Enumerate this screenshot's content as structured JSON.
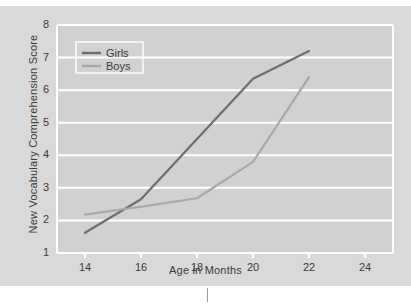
{
  "chart_data": {
    "type": "line",
    "title": "",
    "xlabel": "Age in Months",
    "ylabel": "New Vocabulary Comprehension Score",
    "x": [
      14,
      16,
      18,
      20,
      22
    ],
    "xticks": [
      14,
      16,
      18,
      20,
      22,
      24
    ],
    "yticks": [
      1,
      2,
      3,
      4,
      5,
      6,
      7,
      8
    ],
    "xlim": [
      13,
      25
    ],
    "ylim": [
      1,
      8
    ],
    "grid": "horizontal",
    "legend_position": "top-left",
    "series": [
      {
        "name": "Girls",
        "color": "#6e6e6e",
        "values": [
          1.62,
          2.65,
          4.5,
          6.35,
          7.2
        ]
      },
      {
        "name": "Boys",
        "color": "#a8a8a8",
        "values": [
          2.18,
          2.42,
          2.68,
          3.8,
          6.4
        ]
      }
    ]
  },
  "figure": {
    "background": "#d9d9d9",
    "plot_background": "#d1d1d1",
    "gridline_color": "#ffffff",
    "axis_color": "#ffffff",
    "text_color": "#3a3a3a"
  },
  "axes": {
    "x_tick_labels": [
      "14",
      "16",
      "18",
      "20",
      "22",
      "24"
    ],
    "y_tick_labels": [
      "1",
      "2",
      "3",
      "4",
      "5",
      "6",
      "7",
      "8"
    ]
  },
  "legend": {
    "items": [
      {
        "label": "Girls"
      },
      {
        "label": "Boys"
      }
    ]
  }
}
